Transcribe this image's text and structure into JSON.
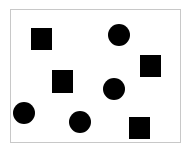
{
  "frame": {
    "x": 10,
    "y": 9,
    "w": 171,
    "h": 134,
    "border_color": "#c8c8c8"
  },
  "fill_color": "#000000",
  "shapes": [
    {
      "type": "square",
      "x": 31,
      "y": 28,
      "w": 21,
      "h": 22
    },
    {
      "type": "circle",
      "cx": 119,
      "cy": 35,
      "r": 11
    },
    {
      "type": "square",
      "x": 140,
      "y": 55,
      "w": 21,
      "h": 22
    },
    {
      "type": "square",
      "x": 52,
      "y": 70,
      "w": 21,
      "h": 23
    },
    {
      "type": "circle",
      "cx": 114,
      "cy": 89,
      "r": 11
    },
    {
      "type": "circle",
      "cx": 24,
      "cy": 113,
      "r": 11
    },
    {
      "type": "circle",
      "cx": 80,
      "cy": 122,
      "r": 11
    },
    {
      "type": "square",
      "x": 129,
      "y": 117,
      "w": 21,
      "h": 22
    }
  ],
  "counts": {
    "squares": 4,
    "circles": 4
  }
}
